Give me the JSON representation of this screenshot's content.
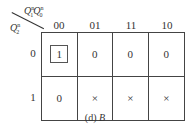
{
  "diagram": {
    "type": "karnaugh-map",
    "col_variables_label": "Q1nQ0n",
    "row_variable_label": "Q2n",
    "col_var_parts": {
      "a": "Q",
      "a_sup": "n",
      "a_sub": "1",
      "b": "Q",
      "b_sup": "n",
      "b_sub": "0"
    },
    "row_var_parts": {
      "a": "Q",
      "a_sup": "n",
      "a_sub": "2"
    },
    "col_headers": [
      "00",
      "01",
      "11",
      "10"
    ],
    "row_headers": [
      "0",
      "1"
    ],
    "cells": [
      [
        "1",
        "0",
        "0",
        "0"
      ],
      [
        "0",
        "×",
        "×",
        "×"
      ]
    ],
    "grouped_cells": [
      [
        0,
        0
      ]
    ],
    "caption_prefix": "(d)",
    "caption_var": "B"
  }
}
